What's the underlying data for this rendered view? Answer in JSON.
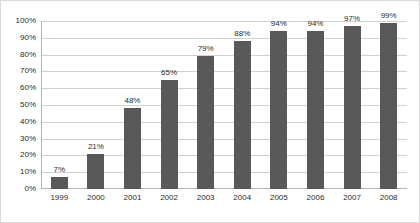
{
  "chart_data": {
    "type": "bar",
    "title": "",
    "subtitle": "",
    "xlabel": "",
    "ylabel": "",
    "categories": [
      "1999",
      "2000",
      "2001",
      "2002",
      "2003",
      "2004",
      "2005",
      "2006",
      "2007",
      "2008"
    ],
    "values": [
      7,
      21,
      48,
      65,
      79,
      88,
      94,
      94,
      97,
      99
    ],
    "data_labels": [
      "7%",
      "21%",
      "48%",
      "65%",
      "79%",
      "88%",
      "94%",
      "94%",
      "97%",
      "99%"
    ],
    "ylim": [
      0,
      100
    ],
    "ytick_values": [
      0,
      10,
      20,
      30,
      40,
      50,
      60,
      70,
      80,
      90,
      100
    ],
    "ytick_labels": [
      "0%",
      "10%",
      "20%",
      "30%",
      "40%",
      "50%",
      "60%",
      "70%",
      "80%",
      "90%",
      "100%"
    ],
    "grid": true,
    "grid_axis": "y",
    "legend": false,
    "legend_position": "none",
    "bar_color": "#595959",
    "gridline_color": "#d0d0d0",
    "axis_color": "#b5b5b5",
    "background_color": "#ffffff",
    "text_color": "#2b2b2b",
    "border_color": "#d9d9d9"
  }
}
